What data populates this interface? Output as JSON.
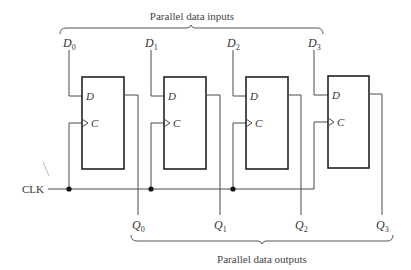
{
  "inputs_caption": "Parallel data inputs",
  "outputs_caption": "Parallel data outputs",
  "clock_label": "CLK",
  "pin_d": "D",
  "pin_c": "C",
  "clock_glyph": ">",
  "flip_flops": [
    {
      "input": "D",
      "input_sub": "0",
      "output": "Q",
      "output_sub": "0"
    },
    {
      "input": "D",
      "input_sub": "1",
      "output": "Q",
      "output_sub": "1"
    },
    {
      "input": "D",
      "input_sub": "2",
      "output": "Q",
      "output_sub": "2"
    },
    {
      "input": "D",
      "input_sub": "3",
      "output": "Q",
      "output_sub": "3"
    }
  ],
  "colors": {
    "wire": "#4a4a4a",
    "box": "#222222",
    "text": "#333333"
  }
}
